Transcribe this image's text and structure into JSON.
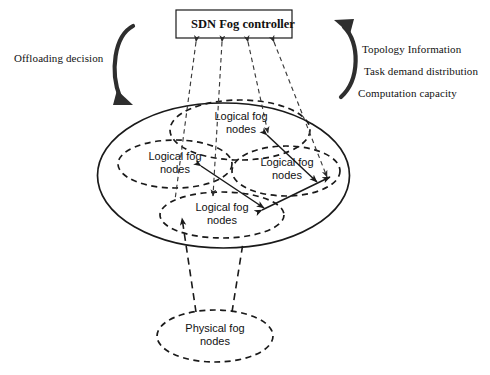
{
  "diagram": {
    "title_label": "SDN Fog controller",
    "left_annotation": "Offloading decision",
    "right_annotations": [
      "Topology Information",
      "Task demand distribution",
      "Computation capacity"
    ],
    "logical_nodes": [
      {
        "id": "top",
        "label": "Logical fog\nnodes"
      },
      {
        "id": "left",
        "label": "Logical fog\nnodes"
      },
      {
        "id": "right",
        "label": "Logical fog\nnodes"
      },
      {
        "id": "bottom",
        "label": "Logical fog\nnodes"
      }
    ],
    "physical_node": {
      "label": "Physical fog\nnodes"
    },
    "colors": {
      "stroke": "#1a1a1a",
      "background": "#ffffff",
      "text": "#111111"
    }
  }
}
